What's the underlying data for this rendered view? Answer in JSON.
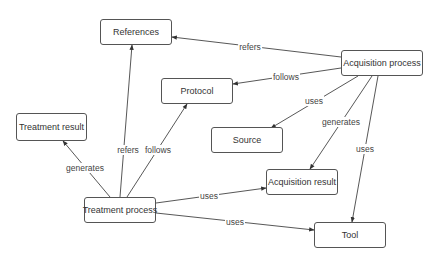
{
  "nodes": {
    "references": {
      "label": "References",
      "x": 100,
      "y": 19,
      "w": 72,
      "h": 26
    },
    "acquisition_process": {
      "label": "Acquisition process",
      "x": 341,
      "y": 50,
      "w": 82,
      "h": 26
    },
    "protocol": {
      "label": "Protocol",
      "x": 161,
      "y": 78,
      "w": 72,
      "h": 26
    },
    "treatment_result": {
      "label": "Treatment result",
      "x": 16,
      "y": 113,
      "w": 71,
      "h": 28
    },
    "source": {
      "label": "Source",
      "x": 211,
      "y": 127,
      "w": 72,
      "h": 26
    },
    "acquisition_result": {
      "label": "Acquisition result",
      "x": 266,
      "y": 169,
      "w": 72,
      "h": 26
    },
    "treatment_process": {
      "label": "Treatment process",
      "x": 84,
      "y": 197,
      "w": 72,
      "h": 26
    },
    "tool": {
      "label": "Tool",
      "x": 314,
      "y": 222,
      "w": 72,
      "h": 26
    }
  },
  "edges": [
    {
      "from": "acquisition_process",
      "to": "references",
      "label": "refers",
      "lx": 250,
      "ly": 47
    },
    {
      "from": "acquisition_process",
      "to": "protocol",
      "label": "follows",
      "lx": 286,
      "ly": 77
    },
    {
      "from": "acquisition_process",
      "to": "source",
      "label": "uses",
      "lx": 314,
      "ly": 101
    },
    {
      "from": "acquisition_process",
      "to": "acquisition_result",
      "label": "generates",
      "lx": 341,
      "ly": 122
    },
    {
      "from": "acquisition_process",
      "to": "tool",
      "label": "uses",
      "lx": 365,
      "ly": 149
    },
    {
      "from": "treatment_process",
      "to": "references",
      "label": "refers",
      "lx": 128,
      "ly": 150
    },
    {
      "from": "treatment_process",
      "to": "protocol",
      "label": "follows",
      "lx": 158,
      "ly": 150
    },
    {
      "from": "treatment_process",
      "to": "treatment_result",
      "label": "generates",
      "lx": 85,
      "ly": 168
    },
    {
      "from": "treatment_process",
      "to": "acquisition_result",
      "label": "uses",
      "lx": 209,
      "ly": 196
    },
    {
      "from": "treatment_process",
      "to": "tool",
      "label": "uses",
      "lx": 235,
      "ly": 222
    }
  ],
  "edge_paths": [
    {
      "x1": 341,
      "y1": 57,
      "x2": 172,
      "y2": 37
    },
    {
      "x1": 341,
      "y1": 68,
      "x2": 233,
      "y2": 84
    },
    {
      "x1": 358,
      "y1": 76,
      "x2": 271,
      "y2": 128
    },
    {
      "x1": 372,
      "y1": 76,
      "x2": 310,
      "y2": 169
    },
    {
      "x1": 378,
      "y1": 76,
      "x2": 352,
      "y2": 222
    },
    {
      "x1": 120,
      "y1": 197,
      "x2": 132,
      "y2": 45
    },
    {
      "x1": 127,
      "y1": 197,
      "x2": 187,
      "y2": 104
    },
    {
      "x1": 110,
      "y1": 197,
      "x2": 63,
      "y2": 141
    },
    {
      "x1": 156,
      "y1": 203,
      "x2": 266,
      "y2": 188
    },
    {
      "x1": 156,
      "y1": 213,
      "x2": 314,
      "y2": 230
    }
  ],
  "colors": {
    "line": "#444444",
    "border": "#555555",
    "text": "#333333"
  }
}
